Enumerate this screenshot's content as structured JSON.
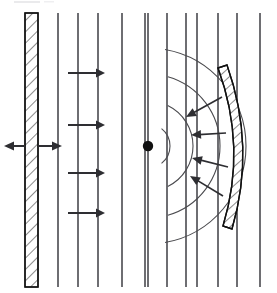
{
  "figure": {
    "width": 277,
    "height": 293,
    "background_color": "#ffffff"
  },
  "colors": {
    "wavefront_line": "#6e6e72",
    "arc_line": "#4a4a4e",
    "hatch_outline": "#111111",
    "hatch_fill": "#ffffff",
    "arrow": "#2e2e32",
    "point_source": "#111111"
  },
  "elements": {
    "flat_wall": {
      "name": "flat-hatched-wall",
      "description": "vertical hatched rectangular plate on the left",
      "x": 25,
      "y": 13,
      "width": 13,
      "height": 274,
      "hatch_angle_deg": 45,
      "hatch_spacing": 8
    },
    "oscillation_arrow": {
      "name": "wall-oscillation-double-arrow",
      "description": "horizontal double headed arrow through the flat wall at mid height",
      "y": 146,
      "left_tip_x": 4,
      "right_tip_x": 62
    },
    "curved_mirror": {
      "name": "curved-hatched-reflector",
      "description": "concave hatched arc on the right bowing rightward",
      "top_x": 218,
      "top_y": 68,
      "bottom_x": 223,
      "bottom_y": 226,
      "bulge_x": 247,
      "thickness": 9,
      "hatch_angle_deg": 45,
      "hatch_spacing": 7
    },
    "point_source": {
      "name": "point-source-dot",
      "cx": 148,
      "cy": 146,
      "r": 5.2
    }
  },
  "wavefronts": {
    "plane_wavefront_label": "vertical plane wavefront lines",
    "plane_lines_x": [
      58,
      78,
      98,
      122,
      145,
      148,
      167,
      186,
      197,
      218,
      237,
      260
    ],
    "plane_lines_top_y": 13,
    "plane_lines_bottom_y": 287,
    "circular_arc_label": "circular wavefront arcs from the point source",
    "circular_arcs_radii": [
      22,
      45,
      72,
      98
    ]
  },
  "propagation_arrows": {
    "label": "rightward propagation arrows from the flat wall",
    "direction": "right",
    "items": [
      {
        "name": "propagation-arrow-1",
        "x1": 68,
        "x2": 105,
        "y": 73
      },
      {
        "name": "propagation-arrow-2",
        "x1": 68,
        "x2": 105,
        "y": 125
      },
      {
        "name": "propagation-arrow-3",
        "x1": 68,
        "x2": 105,
        "y": 173
      },
      {
        "name": "propagation-arrow-4",
        "x1": 68,
        "x2": 105,
        "y": 213
      }
    ]
  },
  "focusing_arrows": {
    "label": "inward arrows from the reflector toward the point source",
    "direction": "toward-point-source",
    "items": [
      {
        "name": "focusing-arrow-1",
        "x1": 222,
        "y1": 97,
        "x2": 186,
        "y2": 117
      },
      {
        "name": "focusing-arrow-2",
        "x1": 226,
        "y1": 133,
        "x2": 191,
        "y2": 135
      },
      {
        "name": "focusing-arrow-3",
        "x1": 228,
        "y1": 167,
        "x2": 192,
        "y2": 158
      },
      {
        "name": "focusing-arrow-4",
        "x1": 223,
        "y1": 196,
        "x2": 190,
        "y2": 176
      }
    ]
  }
}
